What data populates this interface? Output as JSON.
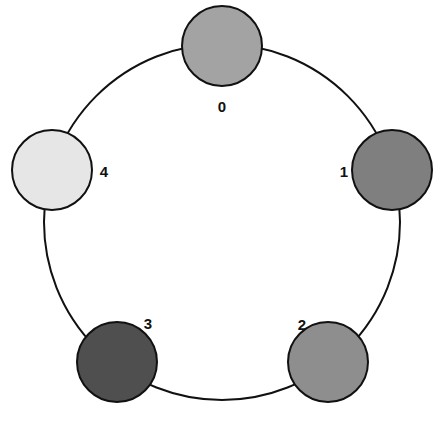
{
  "diagram": {
    "type": "ring-graph",
    "ring": {
      "cx": 222,
      "cy": 222,
      "r": 178,
      "stroke": "#111111"
    },
    "nodes": [
      {
        "id": "0",
        "label": "0",
        "cx": 222,
        "cy": 46,
        "r": 40,
        "fill": "#a3a3a3",
        "label_x": 222,
        "label_y": 112
      },
      {
        "id": "1",
        "label": "1",
        "cx": 392,
        "cy": 170,
        "r": 40,
        "fill": "#7f7f7f",
        "label_x": 344,
        "label_y": 177
      },
      {
        "id": "2",
        "label": "2",
        "cx": 328,
        "cy": 362,
        "r": 40,
        "fill": "#8e8e8e",
        "label_x": 302,
        "label_y": 330
      },
      {
        "id": "3",
        "label": "3",
        "cx": 117,
        "cy": 362,
        "r": 40,
        "fill": "#4f4f4f",
        "label_x": 148,
        "label_y": 329
      },
      {
        "id": "4",
        "label": "4",
        "cx": 52,
        "cy": 170,
        "r": 40,
        "fill": "#e6e6e6",
        "label_x": 104,
        "label_y": 177
      }
    ]
  }
}
